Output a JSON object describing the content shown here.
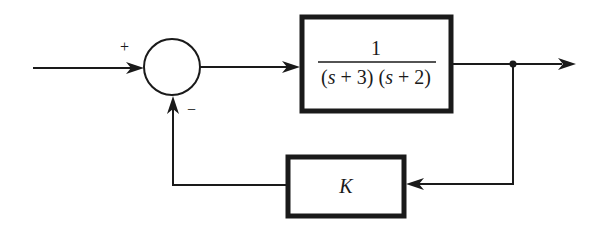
{
  "diagram": {
    "type": "feedback-control-block-diagram",
    "summing_junction": {
      "plus_sign": "+",
      "minus_sign": "−"
    },
    "forward_block": {
      "numerator": "1",
      "denominator_parts": [
        {
          "open": "(",
          "var": "s",
          "rest": " + 3)"
        },
        {
          "open": " (",
          "var": "s",
          "rest": " + 2)"
        }
      ],
      "transfer_function": "1 / ((s + 3)(s + 2))"
    },
    "feedback_block": {
      "gain": "K"
    },
    "colors": {
      "stroke": "#1a1a1a",
      "background": "#ffffff"
    }
  }
}
